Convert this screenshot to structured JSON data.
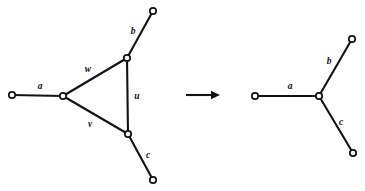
{
  "figure": {
    "caption": "",
    "background_color": "#ffffff",
    "ink_color": "#121212",
    "width": 365,
    "height": 191
  },
  "arrow": {
    "name": "transformation-arrow",
    "symbol": "→",
    "x1": 186,
    "y1": 95,
    "x2": 220,
    "y2": 95
  },
  "left_graph": {
    "title": "triangle-graph",
    "nodes": [
      {
        "id": "L1",
        "label": "",
        "x": 12,
        "y": 95,
        "r": 3.2
      },
      {
        "id": "L2",
        "label": "",
        "x": 63,
        "y": 96,
        "r": 3.2
      },
      {
        "id": "L3",
        "label": "",
        "x": 127,
        "y": 58,
        "r": 3.2
      },
      {
        "id": "L4",
        "label": "",
        "x": 128,
        "y": 134,
        "r": 3.2
      },
      {
        "id": "L5",
        "label": "",
        "x": 153,
        "y": 11,
        "r": 3.2
      },
      {
        "id": "L6",
        "label": "",
        "x": 153,
        "y": 180,
        "r": 3.2
      }
    ],
    "edges": [
      {
        "id": "La",
        "from": "L1",
        "to": "L2",
        "label": "a",
        "label_x": 40,
        "label_y": 87
      },
      {
        "id": "Lw",
        "from": "L2",
        "to": "L3",
        "label": "w",
        "label_x": 88,
        "label_y": 70
      },
      {
        "id": "Lv",
        "from": "L2",
        "to": "L4",
        "label": "v",
        "label_x": 90,
        "label_y": 125
      },
      {
        "id": "Lu",
        "from": "L3",
        "to": "L4",
        "label": "u",
        "label_x": 137,
        "label_y": 97
      },
      {
        "id": "Lb",
        "from": "L3",
        "to": "L5",
        "label": "b",
        "label_x": 133,
        "label_y": 32
      },
      {
        "id": "Lc",
        "from": "L4",
        "to": "L6",
        "label": "c",
        "label_x": 148,
        "label_y": 156
      }
    ]
  },
  "right_graph": {
    "title": "star-graph",
    "nodes": [
      {
        "id": "R1",
        "label": "",
        "x": 255,
        "y": 96,
        "r": 3.2
      },
      {
        "id": "R2",
        "label": "",
        "x": 319,
        "y": 96,
        "r": 3.2
      },
      {
        "id": "R3",
        "label": "",
        "x": 352,
        "y": 39,
        "r": 3.2
      },
      {
        "id": "R4",
        "label": "",
        "x": 353,
        "y": 153,
        "r": 3.2
      }
    ],
    "edges": [
      {
        "id": "Ra",
        "from": "R1",
        "to": "R2",
        "label": "a",
        "label_x": 290,
        "label_y": 87
      },
      {
        "id": "Rb",
        "from": "R2",
        "to": "R3",
        "label": "b",
        "label_x": 329,
        "label_y": 62
      },
      {
        "id": "Rc",
        "from": "R2",
        "to": "R4",
        "label": "c",
        "label_x": 341,
        "label_y": 123
      }
    ]
  }
}
